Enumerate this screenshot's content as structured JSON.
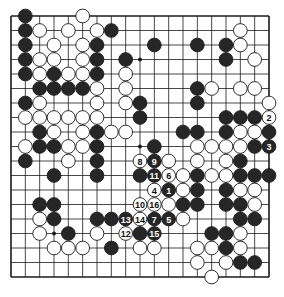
{
  "diagram": {
    "type": "go-board",
    "size": 19,
    "grid": {
      "left": 11,
      "top": 16,
      "right": 269,
      "bottom": 277
    },
    "colors": {
      "line": "#1a1a1a",
      "black": "#262626",
      "white": "#ffffff",
      "background": "#ffffff"
    },
    "star_points": [
      [
        3,
        3
      ],
      [
        9,
        3
      ],
      [
        15,
        3
      ],
      [
        3,
        9
      ],
      [
        9,
        9
      ],
      [
        15,
        9
      ],
      [
        3,
        15
      ],
      [
        9,
        15
      ],
      [
        15,
        15
      ]
    ],
    "stones": [
      {
        "c": 1,
        "r": 0,
        "color": "B"
      },
      {
        "c": 5,
        "r": 0,
        "color": "W"
      },
      {
        "c": 1,
        "r": 1,
        "color": "B"
      },
      {
        "c": 2,
        "r": 1,
        "color": "W"
      },
      {
        "c": 4,
        "r": 1,
        "color": "W"
      },
      {
        "c": 6,
        "r": 1,
        "color": "W"
      },
      {
        "c": 7,
        "r": 1,
        "color": "B"
      },
      {
        "c": 16,
        "r": 1,
        "color": "W"
      },
      {
        "c": 1,
        "r": 2,
        "color": "B"
      },
      {
        "c": 3,
        "r": 2,
        "color": "W"
      },
      {
        "c": 5,
        "r": 2,
        "color": "W"
      },
      {
        "c": 6,
        "r": 2,
        "color": "B"
      },
      {
        "c": 10,
        "r": 2,
        "color": "B"
      },
      {
        "c": 13,
        "r": 2,
        "color": "B"
      },
      {
        "c": 15,
        "r": 2,
        "color": "B"
      },
      {
        "c": 16,
        "r": 2,
        "color": "W"
      },
      {
        "c": 1,
        "r": 3,
        "color": "B"
      },
      {
        "c": 2,
        "r": 3,
        "color": "W"
      },
      {
        "c": 3,
        "r": 3,
        "color": "W"
      },
      {
        "c": 5,
        "r": 3,
        "color": "W"
      },
      {
        "c": 6,
        "r": 3,
        "color": "B"
      },
      {
        "c": 8,
        "r": 3,
        "color": "B"
      },
      {
        "c": 15,
        "r": 3,
        "color": "B"
      },
      {
        "c": 17,
        "r": 3,
        "color": "W"
      },
      {
        "c": 1,
        "r": 4,
        "color": "B"
      },
      {
        "c": 2,
        "r": 4,
        "color": "W"
      },
      {
        "c": 3,
        "r": 4,
        "color": "B"
      },
      {
        "c": 4,
        "r": 4,
        "color": "W"
      },
      {
        "c": 5,
        "r": 4,
        "color": "W"
      },
      {
        "c": 6,
        "r": 4,
        "color": "B"
      },
      {
        "c": 8,
        "r": 4,
        "color": "W"
      },
      {
        "c": 2,
        "r": 5,
        "color": "B"
      },
      {
        "c": 3,
        "r": 5,
        "color": "B"
      },
      {
        "c": 4,
        "r": 5,
        "color": "B"
      },
      {
        "c": 5,
        "r": 5,
        "color": "B"
      },
      {
        "c": 6,
        "r": 5,
        "color": "W"
      },
      {
        "c": 8,
        "r": 5,
        "color": "W"
      },
      {
        "c": 13,
        "r": 5,
        "color": "B"
      },
      {
        "c": 14,
        "r": 5,
        "color": "W"
      },
      {
        "c": 16,
        "r": 5,
        "color": "W"
      },
      {
        "c": 17,
        "r": 5,
        "color": "W"
      },
      {
        "c": 1,
        "r": 6,
        "color": "B"
      },
      {
        "c": 2,
        "r": 6,
        "color": "W"
      },
      {
        "c": 6,
        "r": 6,
        "color": "W"
      },
      {
        "c": 8,
        "r": 6,
        "color": "W"
      },
      {
        "c": 9,
        "r": 6,
        "color": "B"
      },
      {
        "c": 13,
        "r": 6,
        "color": "B"
      },
      {
        "c": 18,
        "r": 6,
        "color": "W"
      },
      {
        "c": 1,
        "r": 7,
        "color": "W"
      },
      {
        "c": 2,
        "r": 7,
        "color": "W"
      },
      {
        "c": 3,
        "r": 7,
        "color": "W"
      },
      {
        "c": 4,
        "r": 7,
        "color": "W"
      },
      {
        "c": 5,
        "r": 7,
        "color": "W"
      },
      {
        "c": 6,
        "r": 7,
        "color": "W"
      },
      {
        "c": 9,
        "r": 7,
        "color": "B"
      },
      {
        "c": 15,
        "r": 7,
        "color": "B"
      },
      {
        "c": 16,
        "r": 7,
        "color": "B"
      },
      {
        "c": 17,
        "r": 7,
        "color": "B"
      },
      {
        "c": 18,
        "r": 7,
        "color": "W",
        "label": "2"
      },
      {
        "c": 2,
        "r": 8,
        "color": "B"
      },
      {
        "c": 3,
        "r": 8,
        "color": "W"
      },
      {
        "c": 5,
        "r": 8,
        "color": "W"
      },
      {
        "c": 6,
        "r": 8,
        "color": "B"
      },
      {
        "c": 7,
        "r": 8,
        "color": "W"
      },
      {
        "c": 8,
        "r": 8,
        "color": "W"
      },
      {
        "c": 12,
        "r": 8,
        "color": "B"
      },
      {
        "c": 13,
        "r": 8,
        "color": "B"
      },
      {
        "c": 15,
        "r": 8,
        "color": "B"
      },
      {
        "c": 16,
        "r": 8,
        "color": "W"
      },
      {
        "c": 17,
        "r": 8,
        "color": "W"
      },
      {
        "c": 18,
        "r": 8,
        "color": "B"
      },
      {
        "c": 1,
        "r": 9,
        "color": "W"
      },
      {
        "c": 2,
        "r": 9,
        "color": "B"
      },
      {
        "c": 3,
        "r": 9,
        "color": "B"
      },
      {
        "c": 4,
        "r": 9,
        "color": "W"
      },
      {
        "c": 5,
        "r": 9,
        "color": "W"
      },
      {
        "c": 6,
        "r": 9,
        "color": "B"
      },
      {
        "c": 10,
        "r": 9,
        "color": "B"
      },
      {
        "c": 13,
        "r": 9,
        "color": "W"
      },
      {
        "c": 14,
        "r": 9,
        "color": "W"
      },
      {
        "c": 15,
        "r": 9,
        "color": "W"
      },
      {
        "c": 16,
        "r": 9,
        "color": "W"
      },
      {
        "c": 17,
        "r": 9,
        "color": "B"
      },
      {
        "c": 18,
        "r": 9,
        "color": "B",
        "label": "3"
      },
      {
        "c": 1,
        "r": 10,
        "color": "B"
      },
      {
        "c": 4,
        "r": 10,
        "color": "W"
      },
      {
        "c": 6,
        "r": 10,
        "color": "B"
      },
      {
        "c": 9,
        "r": 10,
        "color": "W",
        "label": "8"
      },
      {
        "c": 10,
        "r": 10,
        "color": "B",
        "label": "9"
      },
      {
        "c": 11,
        "r": 10,
        "color": "W"
      },
      {
        "c": 13,
        "r": 10,
        "color": "W"
      },
      {
        "c": 15,
        "r": 10,
        "color": "W"
      },
      {
        "c": 16,
        "r": 10,
        "color": "B"
      },
      {
        "c": 3,
        "r": 11,
        "color": "B"
      },
      {
        "c": 6,
        "r": 11,
        "color": "B"
      },
      {
        "c": 9,
        "r": 11,
        "color": "B"
      },
      {
        "c": 10,
        "r": 11,
        "color": "B",
        "label": "11"
      },
      {
        "c": 11,
        "r": 11,
        "color": "W",
        "label": "6"
      },
      {
        "c": 12,
        "r": 11,
        "color": "W"
      },
      {
        "c": 13,
        "r": 11,
        "color": "B"
      },
      {
        "c": 14,
        "r": 11,
        "color": "W"
      },
      {
        "c": 15,
        "r": 11,
        "color": "W"
      },
      {
        "c": 16,
        "r": 11,
        "color": "B"
      },
      {
        "c": 17,
        "r": 11,
        "color": "B"
      },
      {
        "c": 18,
        "r": 11,
        "color": "B"
      },
      {
        "c": 10,
        "r": 12,
        "color": "W",
        "label": "4"
      },
      {
        "c": 11,
        "r": 12,
        "color": "B",
        "label": "1"
      },
      {
        "c": 12,
        "r": 12,
        "color": "W"
      },
      {
        "c": 13,
        "r": 12,
        "color": "B"
      },
      {
        "c": 15,
        "r": 12,
        "color": "B"
      },
      {
        "c": 16,
        "r": 12,
        "color": "W"
      },
      {
        "c": 17,
        "r": 12,
        "color": "W"
      },
      {
        "c": 2,
        "r": 13,
        "color": "B"
      },
      {
        "c": 3,
        "r": 13,
        "color": "B"
      },
      {
        "c": 9,
        "r": 13,
        "color": "W",
        "label": "10"
      },
      {
        "c": 10,
        "r": 13,
        "color": "W",
        "label": "16"
      },
      {
        "c": 11,
        "r": 13,
        "color": "W"
      },
      {
        "c": 12,
        "r": 13,
        "color": "B"
      },
      {
        "c": 13,
        "r": 13,
        "color": "B"
      },
      {
        "c": 15,
        "r": 13,
        "color": "B"
      },
      {
        "c": 16,
        "r": 13,
        "color": "B"
      },
      {
        "c": 17,
        "r": 13,
        "color": "W"
      },
      {
        "c": 2,
        "r": 14,
        "color": "W"
      },
      {
        "c": 3,
        "r": 14,
        "color": "B"
      },
      {
        "c": 6,
        "r": 14,
        "color": "B"
      },
      {
        "c": 7,
        "r": 14,
        "color": "B"
      },
      {
        "c": 8,
        "r": 14,
        "color": "B",
        "label": "13"
      },
      {
        "c": 9,
        "r": 14,
        "color": "W",
        "label": "14"
      },
      {
        "c": 10,
        "r": 14,
        "color": "B",
        "label": "7"
      },
      {
        "c": 11,
        "r": 14,
        "color": "B",
        "label": "5"
      },
      {
        "c": 12,
        "r": 14,
        "color": "W"
      },
      {
        "c": 16,
        "r": 14,
        "color": "B"
      },
      {
        "c": 17,
        "r": 14,
        "color": "B"
      },
      {
        "c": 2,
        "r": 15,
        "color": "W"
      },
      {
        "c": 4,
        "r": 15,
        "color": "B"
      },
      {
        "c": 6,
        "r": 15,
        "color": "W"
      },
      {
        "c": 8,
        "r": 15,
        "color": "W",
        "label": "12"
      },
      {
        "c": 9,
        "r": 15,
        "color": "B"
      },
      {
        "c": 10,
        "r": 15,
        "color": "B",
        "label": "15"
      },
      {
        "c": 14,
        "r": 15,
        "color": "B"
      },
      {
        "c": 15,
        "r": 15,
        "color": "B"
      },
      {
        "c": 16,
        "r": 15,
        "color": "W"
      },
      {
        "c": 3,
        "r": 16,
        "color": "W"
      },
      {
        "c": 4,
        "r": 16,
        "color": "W"
      },
      {
        "c": 5,
        "r": 16,
        "color": "W"
      },
      {
        "c": 7,
        "r": 16,
        "color": "B"
      },
      {
        "c": 9,
        "r": 16,
        "color": "W"
      },
      {
        "c": 10,
        "r": 16,
        "color": "W"
      },
      {
        "c": 13,
        "r": 16,
        "color": "W"
      },
      {
        "c": 14,
        "r": 16,
        "color": "W"
      },
      {
        "c": 15,
        "r": 16,
        "color": "B"
      },
      {
        "c": 16,
        "r": 16,
        "color": "W"
      },
      {
        "c": 13,
        "r": 17,
        "color": "W"
      },
      {
        "c": 15,
        "r": 17,
        "color": "W"
      },
      {
        "c": 16,
        "r": 17,
        "color": "B"
      },
      {
        "c": 17,
        "r": 17,
        "color": "B"
      },
      {
        "c": 14,
        "r": 18,
        "color": "W"
      }
    ]
  }
}
